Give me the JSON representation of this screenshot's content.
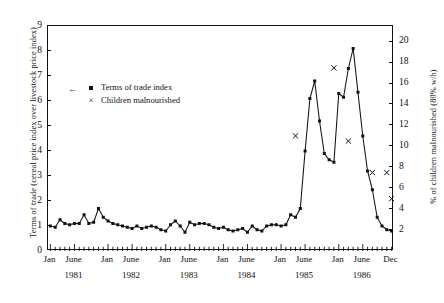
{
  "axes": {
    "left_label": "Terms of trade (cereal price index over livestock price index)",
    "right_label": "% of children malnourished (80% w/h)",
    "left_ticks": [
      "0",
      "1",
      "2",
      "3",
      "4",
      "5",
      "6",
      "7",
      "8",
      "9"
    ],
    "right_ticks": [
      "2",
      "4",
      "6",
      "8",
      "10",
      "12",
      "14",
      "16",
      "18",
      "20"
    ],
    "x_month_labels": [
      "Jan",
      "June",
      "Jan",
      "June",
      "Jan",
      "June",
      "Jan",
      "June",
      "Jan",
      "June",
      "Jan",
      "June",
      "Dec"
    ],
    "x_year_labels": [
      "1981",
      "1982",
      "1983",
      "1984",
      "1985",
      "1986"
    ]
  },
  "legend": {
    "items": [
      {
        "marker": "square",
        "label": "Terms of trade index"
      },
      {
        "marker": "cross",
        "label": "Children malnourished"
      }
    ]
  },
  "chart_data": {
    "type": "line",
    "title": "",
    "xlabel": "",
    "ylabel": "Terms of trade (cereal price index over livestock price index)",
    "y2label": "% of children malnourished (80% w/h)",
    "ylim": [
      0,
      9
    ],
    "y2lim": [
      0,
      21.5
    ],
    "xlim": [
      "1981-01",
      "1986-12"
    ],
    "grid": false,
    "legend_position": "upper-left-inside",
    "series": [
      {
        "name": "Terms of trade index",
        "axis": "left",
        "marker": "square",
        "line": true,
        "x": [
          "1981-01",
          "1981-02",
          "1981-03",
          "1981-04",
          "1981-05",
          "1981-06",
          "1981-07",
          "1981-08",
          "1981-09",
          "1981-10",
          "1981-11",
          "1981-12",
          "1982-01",
          "1982-02",
          "1982-03",
          "1982-04",
          "1982-05",
          "1982-06",
          "1982-07",
          "1982-08",
          "1982-09",
          "1982-10",
          "1982-11",
          "1982-12",
          "1983-01",
          "1983-02",
          "1983-03",
          "1983-04",
          "1983-05",
          "1983-06",
          "1983-07",
          "1983-08",
          "1983-09",
          "1983-10",
          "1983-11",
          "1983-12",
          "1984-01",
          "1984-02",
          "1984-03",
          "1984-04",
          "1984-05",
          "1984-06",
          "1984-07",
          "1984-08",
          "1984-09",
          "1984-10",
          "1984-11",
          "1984-12",
          "1985-01",
          "1985-02",
          "1985-03",
          "1985-04",
          "1985-05",
          "1985-06",
          "1985-07",
          "1985-08",
          "1985-09",
          "1985-10",
          "1985-11",
          "1985-12",
          "1986-01",
          "1986-02",
          "1986-03",
          "1986-04",
          "1986-05",
          "1986-06",
          "1986-07",
          "1986-08",
          "1986-09",
          "1986-10",
          "1986-11",
          "1986-12"
        ],
        "values": [
          1.0,
          0.95,
          1.25,
          1.1,
          1.05,
          1.1,
          1.1,
          1.45,
          1.1,
          1.15,
          1.7,
          1.35,
          1.2,
          1.1,
          1.05,
          1.0,
          0.95,
          0.9,
          1.0,
          0.9,
          0.95,
          1.0,
          0.95,
          0.85,
          0.8,
          1.05,
          1.2,
          1.0,
          0.75,
          1.15,
          1.05,
          1.1,
          1.1,
          1.05,
          0.95,
          0.9,
          0.95,
          0.85,
          0.8,
          0.85,
          0.9,
          0.75,
          1.0,
          0.85,
          0.8,
          1.0,
          1.05,
          1.05,
          1.0,
          1.05,
          1.45,
          1.35,
          1.7,
          4.0,
          6.1,
          6.8,
          5.2,
          3.9,
          3.65,
          3.55,
          6.3,
          6.15,
          7.3,
          8.1,
          6.35,
          4.6,
          3.2,
          2.45,
          1.35,
          1.0,
          0.85,
          0.8
        ],
        "values_tail": [
          0.8,
          0.8,
          0.8,
          0.8,
          0.75,
          0.75,
          0.75,
          0.7
        ]
      },
      {
        "name": "Children malnourished",
        "axis": "right",
        "marker": "cross",
        "line": false,
        "x": [
          "1985-04",
          "1985-12",
          "1986-03",
          "1986-08",
          "1986-11",
          "1986-12"
        ],
        "values": [
          11.0,
          17.5,
          10.5,
          7.5,
          7.5,
          5.0
        ]
      }
    ]
  }
}
